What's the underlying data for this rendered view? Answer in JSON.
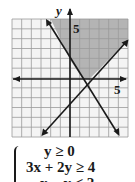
{
  "chart_data": {
    "type": "line",
    "title": "",
    "xlabel": "x",
    "ylabel": "y",
    "xlim": [
      -6,
      6
    ],
    "ylim": [
      -6,
      6
    ],
    "grid": true,
    "tick_labels": {
      "x": [
        "5"
      ],
      "y": [
        "5"
      ]
    },
    "series": [
      {
        "name": "3x + 2y = 4",
        "points": [
          [
            -2,
            5
          ],
          [
            6,
            -7
          ]
        ]
      },
      {
        "name": "x - y = 2",
        "points": [
          [
            -4,
            -6
          ],
          [
            6,
            4
          ]
        ]
      },
      {
        "name": "y = 0",
        "points": [
          [
            -6,
            0
          ],
          [
            6,
            0
          ]
        ]
      }
    ],
    "shaded_region": {
      "description": "feasible region: y >= 0, 3x + 2y >= 4, x - y <= 2",
      "vertices": [
        [
          -2,
          6
        ],
        [
          0.0,
          2
        ],
        [
          1.333,
          0
        ],
        [
          2,
          0
        ],
        [
          6,
          4
        ],
        [
          6,
          6
        ]
      ],
      "color": "#b0b0b0"
    }
  },
  "labels": {
    "y_axis": "y",
    "x_tick": "5",
    "y_tick": "5"
  },
  "system": {
    "lines": [
      "y ≥ 0",
      "3x + 2y ≥ 4",
      "x − y ≤ 2"
    ]
  },
  "colors": {
    "grid": "#9a9a9a",
    "axis": "#1a1a1a",
    "shade": "#b4b4b4",
    "background": "#f4f4f4"
  }
}
